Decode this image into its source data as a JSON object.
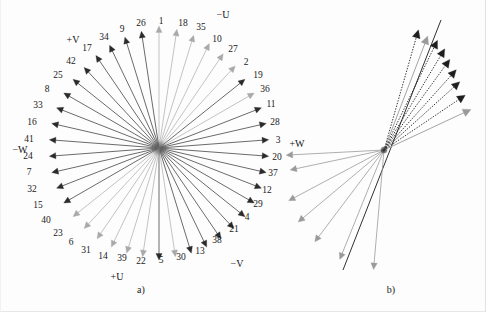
{
  "figure": {
    "background_color": "#fdfdfd",
    "panels": [
      {
        "id": "a",
        "caption": "a)",
        "caption_x": 140,
        "caption_y": 289
      },
      {
        "id": "b",
        "caption": "b)",
        "caption_y": 289,
        "caption_x": 90
      }
    ]
  },
  "panel_a": {
    "center": {
      "x": 158,
      "y": 148
    },
    "hub_color": "#6d6d6d",
    "axis_labels": [
      {
        "text": "−U",
        "x": 222,
        "y": 15
      },
      {
        "text": "+V",
        "x": 72,
        "y": 40
      },
      {
        "text": "−W",
        "x": 19,
        "y": 150
      },
      {
        "text": "+W",
        "x": 296,
        "y": 144
      },
      {
        "text": "+U",
        "x": 116,
        "y": 277
      },
      {
        "text": "−V",
        "x": 236,
        "y": 264
      }
    ],
    "colors": {
      "dark_arrow": "#2b2b2b",
      "light_arrow": "#a9a9a9",
      "mid_arrow": "#8c8c8c"
    },
    "vector_count": 42,
    "vectors": [
      {
        "n": "1",
        "angle": 90,
        "len": 122,
        "color": "light",
        "lx": 160,
        "ly": 22
      },
      {
        "n": "18",
        "angle": 81.4,
        "len": 120,
        "color": "light",
        "lx": 182,
        "ly": 24
      },
      {
        "n": "35",
        "angle": 72.9,
        "len": 118,
        "color": "light",
        "lx": 200,
        "ly": 28
      },
      {
        "n": "10",
        "angle": 64.3,
        "len": 116,
        "color": "light",
        "lx": 216,
        "ly": 40
      },
      {
        "n": "27",
        "angle": 55.7,
        "len": 114,
        "color": "light",
        "lx": 232,
        "ly": 50
      },
      {
        "n": "2",
        "angle": 47.1,
        "len": 112,
        "color": "light",
        "lx": 245,
        "ly": 63
      },
      {
        "n": "19",
        "angle": 38.6,
        "len": 110,
        "color": "dark",
        "lx": 257,
        "ly": 76
      },
      {
        "n": "36",
        "angle": 30,
        "len": 110,
        "color": "light",
        "lx": 264,
        "ly": 90
      },
      {
        "n": "11",
        "angle": 21.4,
        "len": 110,
        "color": "dark",
        "lx": 270,
        "ly": 105
      },
      {
        "n": "28",
        "angle": 12.9,
        "len": 110,
        "color": "dark",
        "lx": 274,
        "ly": 123
      },
      {
        "n": "3",
        "angle": 4.3,
        "len": 110,
        "color": "dark",
        "lx": 277,
        "ly": 141
      },
      {
        "n": "20",
        "angle": -4.3,
        "len": 110,
        "color": "dark",
        "lx": 276,
        "ly": 158
      },
      {
        "n": "37",
        "angle": -12.9,
        "len": 110,
        "color": "dark",
        "lx": 272,
        "ly": 174
      },
      {
        "n": "12",
        "angle": -21.4,
        "len": 110,
        "color": "dark",
        "lx": 266,
        "ly": 191
      },
      {
        "n": "29",
        "angle": -30,
        "len": 110,
        "color": "dark",
        "lx": 257,
        "ly": 205
      },
      {
        "n": "4",
        "angle": -38.6,
        "len": 110,
        "color": "dark",
        "lx": 246,
        "ly": 218
      },
      {
        "n": "21",
        "angle": -47.1,
        "len": 110,
        "color": "dark",
        "lx": 233,
        "ly": 230
      },
      {
        "n": "38",
        "angle": -55.7,
        "len": 110,
        "color": "dark",
        "lx": 216,
        "ly": 241
      },
      {
        "n": "13",
        "angle": -64.3,
        "len": 110,
        "color": "dark",
        "lx": 199,
        "ly": 252
      },
      {
        "n": "30",
        "angle": -72.9,
        "len": 110,
        "color": "dark",
        "lx": 180,
        "ly": 258
      },
      {
        "n": "5",
        "angle": -81.4,
        "len": 110,
        "color": "light",
        "lx": 160,
        "ly": 261
      },
      {
        "n": "22",
        "angle": -90,
        "len": 112,
        "color": "dark",
        "lx": 140,
        "ly": 262
      },
      {
        "n": "39",
        "angle": -98.6,
        "len": 110,
        "color": "light",
        "lx": 121,
        "ly": 259
      },
      {
        "n": "14",
        "angle": -107.1,
        "len": 110,
        "color": "light",
        "lx": 102,
        "ly": 257
      },
      {
        "n": "31",
        "angle": -115.7,
        "len": 110,
        "color": "light",
        "lx": 85,
        "ly": 251
      },
      {
        "n": "6",
        "angle": -124.3,
        "len": 110,
        "color": "light",
        "lx": 70,
        "ly": 243
      },
      {
        "n": "23",
        "angle": -132.9,
        "len": 110,
        "color": "light",
        "lx": 57,
        "ly": 234
      },
      {
        "n": "40",
        "angle": -141.4,
        "len": 110,
        "color": "light",
        "lx": 45,
        "ly": 221
      },
      {
        "n": "15",
        "angle": -150,
        "len": 110,
        "color": "dark",
        "lx": 37,
        "ly": 206
      },
      {
        "n": "32",
        "angle": -158.6,
        "len": 110,
        "color": "dark",
        "lx": 31,
        "ly": 190
      },
      {
        "n": "7",
        "angle": -167.1,
        "len": 110,
        "color": "dark",
        "lx": 28,
        "ly": 173
      },
      {
        "n": "24",
        "angle": -175.7,
        "len": 110,
        "color": "dark",
        "lx": 27,
        "ly": 157
      },
      {
        "n": "41",
        "angle": 175.7,
        "len": 110,
        "color": "dark",
        "lx": 28,
        "ly": 140
      },
      {
        "n": "16",
        "angle": 167.1,
        "len": 110,
        "color": "dark",
        "lx": 31,
        "ly": 123
      },
      {
        "n": "33",
        "angle": 158.6,
        "len": 110,
        "color": "dark",
        "lx": 37,
        "ly": 106
      },
      {
        "n": "8",
        "angle": 150,
        "len": 110,
        "color": "dark",
        "lx": 46,
        "ly": 90
      },
      {
        "n": "25",
        "angle": 141.4,
        "len": 110,
        "color": "dark",
        "lx": 57,
        "ly": 76
      },
      {
        "n": "42",
        "angle": 132.9,
        "len": 110,
        "color": "dark",
        "lx": 70,
        "ly": 62
      },
      {
        "n": "17",
        "angle": 124.3,
        "len": 112,
        "color": "dark",
        "lx": 86,
        "ly": 49
      },
      {
        "n": "34",
        "angle": 115.7,
        "len": 114,
        "color": "dark",
        "lx": 103,
        "ly": 38
      },
      {
        "n": "9",
        "angle": 107.1,
        "len": 116,
        "color": "dark",
        "lx": 121,
        "ly": 30
      },
      {
        "n": "26",
        "angle": 98.6,
        "len": 118,
        "color": "dark",
        "lx": 140,
        "ly": 24
      }
    ]
  },
  "panel_b": {
    "center": {
      "x": 83,
      "y": 150
    },
    "hub_color": "#2b2b2b",
    "colors": {
      "dotted_arrow": "#1e1e1e",
      "solid_gray_arrow": "#9a9a9a",
      "diagonal_line": "#1a1a1a"
    },
    "diagonal_line": {
      "x1": 140,
      "y1": 20,
      "x2": 42,
      "y2": 270
    },
    "upper_vectors": [
      {
        "angle": 74,
        "len": 125,
        "style": "dotted"
      },
      {
        "angle": 69,
        "len": 122,
        "style": "solid-gray"
      },
      {
        "angle": 64,
        "len": 122,
        "style": "dotted"
      },
      {
        "angle": 59,
        "len": 118,
        "style": "dotted"
      },
      {
        "angle": 54,
        "len": 112,
        "style": "dotted"
      },
      {
        "angle": 48,
        "len": 108,
        "style": "dotted"
      },
      {
        "angle": 42,
        "len": 102,
        "style": "dotted"
      },
      {
        "angle": 34,
        "len": 98,
        "style": "dotted"
      },
      {
        "angle": 25,
        "len": 96,
        "style": "solid-gray"
      }
    ],
    "lower_vectors": [
      {
        "angle": -168,
        "len": 96,
        "style": "solid-gray"
      },
      {
        "angle": -177,
        "len": 98,
        "style": "solid-gray"
      },
      {
        "angle": -152,
        "len": 108,
        "style": "solid-gray"
      },
      {
        "angle": -140,
        "len": 112,
        "style": "solid-gray"
      },
      {
        "angle": -127,
        "len": 115,
        "style": "solid-gray"
      },
      {
        "angle": -112,
        "len": 118,
        "style": "solid-gray"
      },
      {
        "angle": -95,
        "len": 120,
        "style": "solid-gray"
      }
    ]
  },
  "chart_data": {
    "type": "scatter",
    "title": "",
    "panel_a_vector_numbers": [
      1,
      18,
      35,
      10,
      27,
      2,
      19,
      36,
      11,
      28,
      3,
      20,
      37,
      12,
      29,
      4,
      21,
      38,
      13,
      30,
      5,
      22,
      39,
      14,
      31,
      6,
      23,
      40,
      15,
      32,
      7,
      24,
      41,
      16,
      33,
      8,
      25,
      42,
      17,
      34,
      9,
      26
    ],
    "panel_a_angles_deg": [
      90,
      81.4,
      72.9,
      64.3,
      55.7,
      47.1,
      38.6,
      30,
      21.4,
      12.9,
      4.3,
      -4.3,
      -12.9,
      -21.4,
      -30,
      -38.6,
      -47.1,
      -55.7,
      -64.3,
      -72.9,
      -81.4,
      -90,
      -98.6,
      -107.1,
      -115.7,
      -124.3,
      -132.9,
      -141.4,
      -150,
      -158.6,
      -167.1,
      -175.7,
      175.7,
      167.1,
      158.6,
      150,
      141.4,
      132.9,
      124.3,
      115.7,
      107.1,
      98.6
    ],
    "axis_names": [
      "+U",
      "−U",
      "+V",
      "−V",
      "+W",
      "−W"
    ],
    "angular_step_deg": 8.571,
    "legend": [],
    "grid": false,
    "xlabel": "",
    "ylabel": ""
  }
}
